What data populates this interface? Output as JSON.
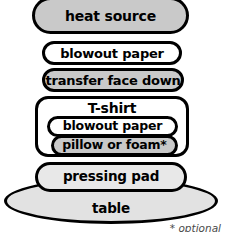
{
  "diagram": {
    "layers": [
      {
        "id": "heat_source",
        "label": "heat source",
        "fill": "#c9c9c9"
      },
      {
        "id": "blowout_top",
        "label": "blowout paper",
        "fill": "#ffffff"
      },
      {
        "id": "transfer",
        "label": "transfer face down",
        "fill": "#c9c9c9"
      },
      {
        "id": "tshirt",
        "label": "T-shirt",
        "fill": "#ffffff"
      },
      {
        "id": "blowout_inner",
        "label": "blowout paper",
        "fill": "#ffffff"
      },
      {
        "id": "pillow",
        "label": "pillow or foam*",
        "fill": "#c9c9c9"
      },
      {
        "id": "pressing_pad",
        "label": "pressing pad",
        "fill": "#e8e8e8"
      },
      {
        "id": "table",
        "label": "table",
        "fill": "#e2e2e2"
      }
    ],
    "footnote": "* optional",
    "stroke_color": "#000000",
    "text_color": "#000000"
  }
}
